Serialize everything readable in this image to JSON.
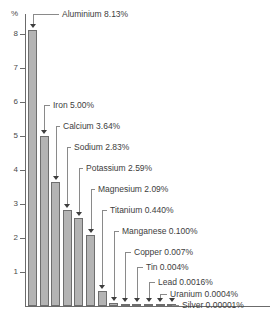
{
  "chart_data": {
    "type": "bar",
    "title": "",
    "subtitle": "",
    "xlabel": "",
    "ylabel": "%",
    "ylim": [
      0,
      8.6
    ],
    "grid": false,
    "legend": "none",
    "categories": [
      "Aluminium",
      "Iron",
      "Calcium",
      "Sodium",
      "Potassium",
      "Magnesium",
      "Titanium",
      "Manganese",
      "Copper",
      "Tin",
      "Lead",
      "Uranium",
      "Silver"
    ],
    "values": [
      8.13,
      5.0,
      3.64,
      2.83,
      2.59,
      2.09,
      0.44,
      0.1,
      0.007,
      0.004,
      0.0016,
      0.0004,
      1e-05
    ],
    "value_strings": [
      "8.13%",
      "5.00%",
      "3.64%",
      "2.83%",
      "2.59%",
      "2.09%",
      "0.440%",
      "0.100%",
      "0.007%",
      "0.004%",
      "0.0016%",
      "0.0004%",
      "0.00001%"
    ],
    "annotations": [
      "Aluminium 8.13%",
      "Iron 5.00%",
      "Calcium 3.64%",
      "Sodium 2.83%",
      "Potassium 2.59%",
      "Magnesium 2.09%",
      "Titanium 0.440%",
      "Manganese 0.100%",
      "Copper 0.007%",
      "Tin 0.004%",
      "Lead 0.0016%",
      "Uranium 0.0004%",
      "Silver 0.00001%"
    ],
    "yticks": [
      "1",
      "2",
      "3",
      "4",
      "5",
      "6",
      "7",
      "8"
    ],
    "ytick_values": [
      1,
      2,
      3,
      4,
      5,
      6,
      7,
      8
    ],
    "y_unit_label": "%",
    "colors": {
      "bar_fill": "#b4b4b4",
      "bar_stroke": "#6e6e6e",
      "axis": "#6b6b6b",
      "text": "#3d3d3d",
      "leader": "#8a8a8a"
    }
  }
}
